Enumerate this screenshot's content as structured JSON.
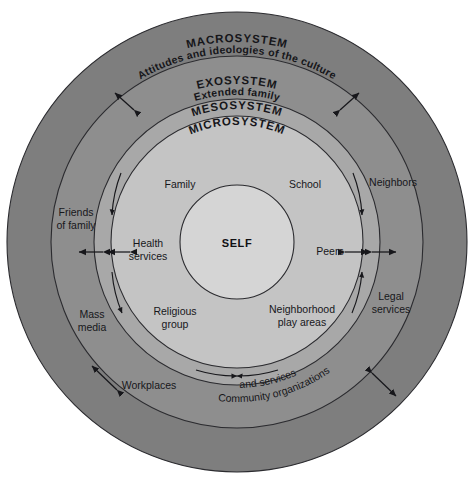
{
  "diagram": {
    "center_label": "SELF",
    "background_color": "#ffffff",
    "stroke_color": "#2b2b2f",
    "text_color": "#17171b"
  },
  "rings": [
    {
      "id": "macrosystem",
      "title": "MACROSYSTEM",
      "subtitle": "Attitudes and ideologies of the culture",
      "color": "#7e7e7e",
      "outer_radius": 230,
      "inner_radius": 186
    },
    {
      "id": "exosystem",
      "title": "EXOSYSTEM",
      "subtitle": "Extended family",
      "color": "#8e8e8e",
      "outer_radius": 186,
      "inner_radius": 143
    },
    {
      "id": "mesosystem",
      "title": "MESOSYSTEM",
      "subtitle": "",
      "color": "#a8a8a8",
      "outer_radius": 143,
      "inner_radius": 126
    },
    {
      "id": "microsystem",
      "title": "MICROSYSTEM",
      "subtitle": "",
      "color": "#c4c4c4",
      "outer_radius": 126,
      "inner_radius": 57
    },
    {
      "id": "self",
      "title": "SELF",
      "subtitle": "",
      "color": "#d5d5d5",
      "outer_radius": 57,
      "inner_radius": 0
    }
  ],
  "microsystem_nodes": [
    {
      "id": "family",
      "label": "Family"
    },
    {
      "id": "school",
      "label": "School"
    },
    {
      "id": "health-services",
      "label": "Health\nservices",
      "line1": "Health",
      "line2": "services"
    },
    {
      "id": "peers",
      "label": "Peers"
    },
    {
      "id": "religious-group",
      "label": "Religious\ngroup",
      "line1": "Religious",
      "line2": "group"
    },
    {
      "id": "neighborhood-play-areas",
      "label": "Neighborhood\nplay areas",
      "line1": "Neighborhood",
      "line2": "play areas"
    }
  ],
  "exosystem_nodes": [
    {
      "id": "friends-of-family",
      "label": "Friends\nof family",
      "line1": "Friends",
      "line2": "of family"
    },
    {
      "id": "neighbors",
      "label": "Neighbors",
      "line1": "Neighbors",
      "line2": ""
    },
    {
      "id": "legal-services",
      "label": "Legal\nservices",
      "line1": "Legal",
      "line2": "services"
    },
    {
      "id": "mass-media",
      "label": "Mass\nmedia",
      "line1": "Mass",
      "line2": "media"
    },
    {
      "id": "workplaces",
      "label": "Workplaces",
      "line1": "Workplaces",
      "line2": ""
    },
    {
      "id": "community-organizations",
      "label": "Community organizations and services",
      "line1": "Community organizations",
      "line2": "and services"
    }
  ]
}
